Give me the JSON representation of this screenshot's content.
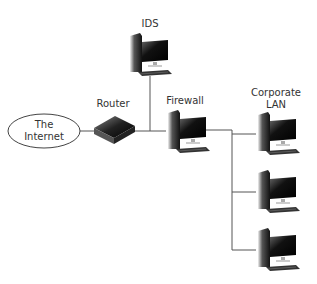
{
  "diagram": {
    "nodes": [
      {
        "id": "internet",
        "label_line1": "The",
        "label_line2": "Internet",
        "type": "cloud-ellipse"
      },
      {
        "id": "router",
        "label": "Router",
        "type": "router"
      },
      {
        "id": "ids",
        "label": "IDS",
        "type": "computer"
      },
      {
        "id": "firewall",
        "label": "Firewall",
        "type": "computer"
      },
      {
        "id": "lan",
        "label_line1": "Corporate",
        "label_line2": "LAN",
        "type": "computer-group",
        "count": 3
      }
    ],
    "edges": [
      {
        "from": "internet",
        "to": "router"
      },
      {
        "from": "router",
        "to": "firewall"
      },
      {
        "from": "ids",
        "to": "router-firewall-link"
      },
      {
        "from": "firewall",
        "to": "lan"
      }
    ],
    "colors": {
      "line": "#555555",
      "text": "#333333",
      "device_dark": "#1a1a1a"
    }
  }
}
